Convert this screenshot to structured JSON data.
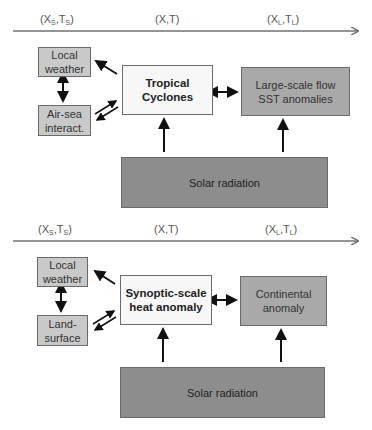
{
  "panels": [
    {
      "axis": {
        "labels": [
          {
            "main": "(X",
            "sub1": "S",
            "mid": ",T",
            "sub2": "S",
            "end": ")"
          },
          {
            "main": "(X,T)",
            "sub1": "",
            "mid": "",
            "sub2": "",
            "end": ""
          },
          {
            "main": "(X",
            "sub1": "L",
            "mid": ",T",
            "sub2": "L",
            "end": ")"
          }
        ]
      },
      "boxes": {
        "top_left": "Local weather",
        "bottom_left": "Air-sea interact.",
        "center": "Tropical Cyclones",
        "right": "Large-scale flow SST anomalies",
        "bottom": "Solar radiation"
      }
    },
    {
      "axis": {
        "labels": [
          {
            "main": "(X",
            "sub1": "S",
            "mid": ",T",
            "sub2": "S",
            "end": ")"
          },
          {
            "main": "(X,T)",
            "sub1": "",
            "mid": "",
            "sub2": "",
            "end": ""
          },
          {
            "main": "(X",
            "sub1": "L",
            "mid": ",T",
            "sub2": "L",
            "end": ")"
          }
        ]
      },
      "boxes": {
        "top_left": "Local weather",
        "bottom_left": "Land-surface",
        "center": "Synoptic-scale heat anomaly",
        "right": "Continental anomaly",
        "bottom": "Solar radiation"
      }
    }
  ],
  "colors": {
    "small_box": "#c9c9c9",
    "center_box": "#f7f7f7",
    "large_box": "#a9a9a9",
    "solar_box": "#8d8d8d",
    "axis": "#707070",
    "arrow": "#111111"
  }
}
